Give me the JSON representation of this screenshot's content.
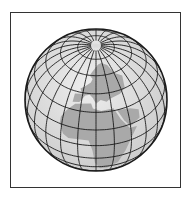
{
  "figure": {
    "type": "orthographic-globe",
    "frame": {
      "x": 10,
      "y": 12,
      "width": 171,
      "height": 176
    },
    "globe": {
      "center_x": 96,
      "center_y": 100,
      "radius": 71,
      "tilt_deg": 40,
      "graticule_step_deg": 15
    },
    "colors": {
      "background": "#ffffff",
      "frame_border": "#333333",
      "ocean": "#dcdcdc",
      "land": "#a9a9a9",
      "graticule": "#1a1a1a",
      "pole_highlight": "#f0f0f0"
    }
  }
}
